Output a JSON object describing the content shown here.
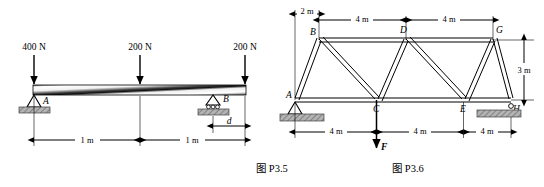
{
  "page": {
    "width": 544,
    "height": 187,
    "background": "#ffffff",
    "ink": "#000000"
  },
  "figures": [
    {
      "id": "fig-beam",
      "caption": "图 P3.5",
      "type": "beam-free-body-diagram",
      "description": "Simply supported overhanging beam with three downward point loads",
      "loads": [
        {
          "label": "400 N",
          "value": 400,
          "unit": "N",
          "direction": "down",
          "at": "left-end-A"
        },
        {
          "label": "200 N",
          "value": 200,
          "unit": "N",
          "direction": "down",
          "at": "midspan"
        },
        {
          "label": "200 N",
          "value": 200,
          "unit": "N",
          "direction": "down",
          "at": "right-end"
        }
      ],
      "supports": [
        {
          "label": "A",
          "kind": "pin",
          "position": "left"
        },
        {
          "label": "B",
          "kind": "roller",
          "position": "right-of-midspan"
        }
      ],
      "dimensions": [
        {
          "label": "1 m",
          "value": 1,
          "unit": "m",
          "span": "A-to-midspan"
        },
        {
          "label": "1 m",
          "value": 1,
          "unit": "m",
          "span": "midspan-to-right-end"
        },
        {
          "label": "d",
          "value": null,
          "unit": "m",
          "span": "B-to-right-end",
          "unknown": true
        }
      ]
    },
    {
      "id": "fig-truss",
      "caption": "图 P3.6",
      "type": "pin-jointed-truss",
      "description": "Warren truss with verticals, pin support at A and roller support at H, downward load F at C",
      "nodes": [
        {
          "label": "A",
          "chord": "bottom"
        },
        {
          "label": "B",
          "chord": "top"
        },
        {
          "label": "C",
          "chord": "bottom"
        },
        {
          "label": "D",
          "chord": "top"
        },
        {
          "label": "E",
          "chord": "bottom"
        },
        {
          "label": "G",
          "chord": "top"
        },
        {
          "label": "H",
          "chord": "bottom"
        }
      ],
      "supports": [
        {
          "label": "A",
          "kind": "pin"
        },
        {
          "label": "H",
          "kind": "roller"
        }
      ],
      "loads": [
        {
          "label": "F",
          "direction": "down",
          "at": "C"
        }
      ],
      "dimensions_top": [
        {
          "label": "2 m",
          "value": 2,
          "unit": "m",
          "span": "A-to-B"
        },
        {
          "label": "4 m",
          "value": 4,
          "unit": "m",
          "span": "B-to-D"
        },
        {
          "label": "4 m",
          "value": 4,
          "unit": "m",
          "span": "D-to-G"
        }
      ],
      "dimensions_bottom": [
        {
          "label": "4 m",
          "value": 4,
          "unit": "m",
          "span": "A-to-C"
        },
        {
          "label": "4 m",
          "value": 4,
          "unit": "m",
          "span": "C-to-E"
        },
        {
          "label": "4 m",
          "value": 4,
          "unit": "m",
          "span": "E-to-H"
        }
      ],
      "dimensions_vertical": [
        {
          "label": "3 m",
          "value": 3,
          "unit": "m",
          "span": "bottom-chord-to-top-chord"
        }
      ]
    }
  ],
  "colors": {
    "ink": "#000000",
    "ground_hatch": "#a8a8a8",
    "ground_hatch_edge": "#4a4a4a",
    "beam_light": "#ffffff",
    "beam_dark": "#1a1a1a",
    "member_fill": "#ffffff"
  }
}
